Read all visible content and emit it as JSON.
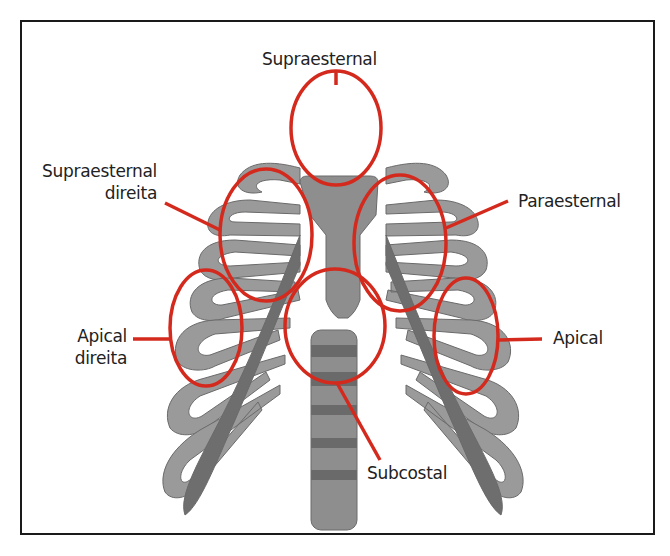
{
  "diagram": {
    "colors": {
      "marker": "#d42a1e",
      "bone_light": "#9a9a9a",
      "bone_dark": "#6e6e6e",
      "cartilage": "#5c5c5c",
      "border": "#1a1a1a"
    },
    "labels": [
      {
        "id": "supraesternal",
        "text": "Supraesternal"
      },
      {
        "id": "supraesternal-direita",
        "line1": "Supraesternal",
        "line2": "direita"
      },
      {
        "id": "paraesternal",
        "text": "Paraesternal"
      },
      {
        "id": "apical-direita",
        "line1": "Apical",
        "line2": "direita"
      },
      {
        "id": "apical",
        "text": "Apical"
      },
      {
        "id": "subcostal",
        "text": "Subcostal"
      }
    ]
  }
}
